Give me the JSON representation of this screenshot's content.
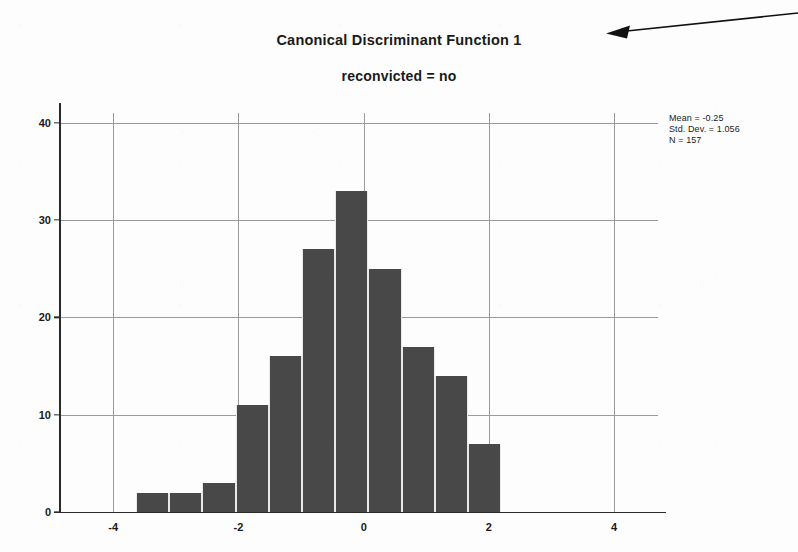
{
  "chart_data": {
    "type": "bar",
    "title": "Canonical Discriminant Function 1",
    "subtitle": "reconvicted = no",
    "xlabel": "",
    "ylabel": "",
    "grid": true,
    "legend": "none",
    "xlim": [
      -4.85,
      4.7
    ],
    "ylim": [
      0,
      41
    ],
    "xticks": [
      "-4",
      "-2",
      "0",
      "2",
      "4"
    ],
    "xtick_values": [
      -4,
      -2,
      0,
      2,
      4
    ],
    "yticks": [
      "0",
      "10",
      "20",
      "30",
      "40"
    ],
    "ytick_values": [
      0,
      10,
      20,
      30,
      40
    ],
    "bin_width": 0.53,
    "x": [
      -3.37,
      -2.84,
      -2.31,
      -1.78,
      -1.25,
      -0.72,
      -0.19,
      0.34,
      0.87,
      1.4,
      1.93
    ],
    "categories": [
      "-3.37",
      "-2.84",
      "-2.31",
      "-1.78",
      "-1.25",
      "-0.72",
      "-0.19",
      "0.34",
      "0.87",
      "1.40",
      "1.93"
    ],
    "values": [
      2,
      2,
      3,
      11,
      16,
      27,
      33,
      25,
      17,
      14,
      7
    ],
    "bar_color": "#484848"
  },
  "statistics": {
    "mean_label": "Mean = -0.25",
    "std_dev_label": "Std. Dev. = 1.056",
    "n_label": "N = 157"
  },
  "annotations": {
    "arrow_label": "pointer-arrow"
  }
}
